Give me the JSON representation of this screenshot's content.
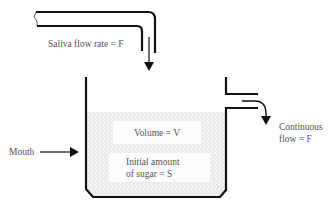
{
  "diagram": {
    "type": "mouth-saliva-sugar-clearance-model",
    "labels": {
      "saliva_flow": "Saliva flow rate = F",
      "mouth": "Mouth",
      "volume": "Volume = V",
      "initial_sugar_line1": "Initial amount",
      "initial_sugar_line2": "of sugar = S",
      "continuous_flow_line1": "Continuous",
      "continuous_flow_line2": "flow = F"
    },
    "colors": {
      "ink": "#111111",
      "text": "#555555",
      "liquid_stipple": "#cfcfcf",
      "background": "#ffffff"
    }
  }
}
